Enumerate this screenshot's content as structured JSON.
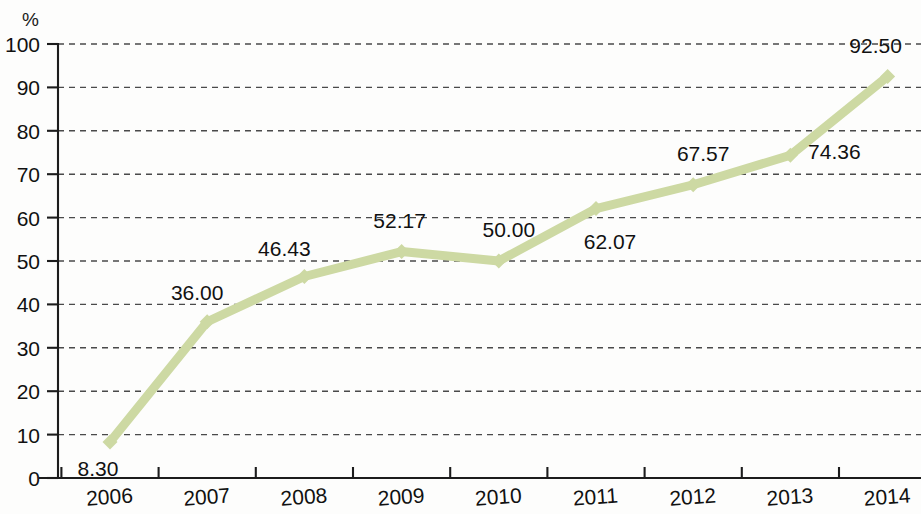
{
  "chart_data": {
    "type": "line",
    "title": "",
    "subtitle": "",
    "xlabel": "",
    "ylabel": "",
    "unit_label": "%",
    "categories": [
      "2006",
      "2007",
      "2008",
      "2009",
      "2010",
      "2011",
      "2012",
      "2013",
      "2014"
    ],
    "values": [
      8.3,
      36.0,
      46.43,
      52.17,
      50.0,
      62.07,
      67.57,
      74.36,
      92.5
    ],
    "point_labels": [
      "8.30",
      "36.00",
      "46.43",
      "52.17",
      "50.00",
      "62.07",
      "67.57",
      "74.36",
      "92.50"
    ],
    "series": [
      {
        "name": "",
        "values": [
          8.3,
          36.0,
          46.43,
          52.17,
          50.0,
          62.07,
          67.57,
          74.36,
          92.5
        ]
      }
    ],
    "ylim": [
      0,
      100
    ],
    "y_ticks": [
      "0",
      "10",
      "20",
      "30",
      "40",
      "50",
      "60",
      "70",
      "80",
      "90",
      "100"
    ],
    "y_tick_values": [
      0,
      10,
      20,
      30,
      40,
      50,
      60,
      70,
      80,
      90,
      100
    ],
    "grid": true,
    "grid_axis": "y",
    "legend": false,
    "legend_position": "none",
    "annotations": [],
    "colors": {
      "series_line": "#cdd9a3",
      "axis": "#1c1c1c",
      "gridline": "#3b3b3b",
      "text": "#111111",
      "background": "#fdfdfc"
    },
    "label_offsets": [
      {
        "dx": -12,
        "dy": 34
      },
      {
        "dx": -10,
        "dy": -22
      },
      {
        "dx": -20,
        "dy": -20
      },
      {
        "dx": -2,
        "dy": -24
      },
      {
        "dx": 10,
        "dy": -24
      },
      {
        "dx": 14,
        "dy": 40
      },
      {
        "dx": 10,
        "dy": -24
      },
      {
        "dx": 44,
        "dy": 4
      },
      {
        "dx": -12,
        "dy": -24
      }
    ]
  }
}
